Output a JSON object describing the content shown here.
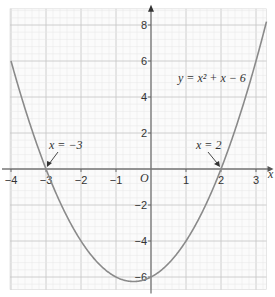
{
  "chart_data": {
    "type": "line",
    "title": "",
    "equation_label": "y = x² + x − 6",
    "xlabel": "x",
    "ylabel": "y",
    "origin_label": "O",
    "xlim": [
      -4.0,
      3.3
    ],
    "ylim": [
      -6.7,
      8.9
    ],
    "x_ticks": [
      -4,
      -3,
      -2,
      -1,
      1,
      2,
      3
    ],
    "x_tick_labels": [
      "−4",
      "−3",
      "−2",
      "−1",
      "1",
      "2",
      "3"
    ],
    "y_ticks": [
      8,
      6,
      4,
      2,
      -2,
      -4,
      -6
    ],
    "y_tick_labels": [
      "8",
      "6",
      "4",
      "2",
      "−2",
      "−4",
      "−6"
    ],
    "grid": true,
    "series": [
      {
        "name": "y = x² + x − 6",
        "color": "#8a8a8a",
        "x": [
          -4,
          -3.5,
          -3,
          -2.5,
          -2,
          -1.5,
          -1,
          -0.5,
          0,
          0.5,
          1,
          1.5,
          2,
          2.5,
          3,
          3.3
        ],
        "y": [
          6,
          2.75,
          0,
          -2.25,
          -4,
          -5.25,
          -6,
          -6.25,
          -6,
          -5.25,
          -4,
          -2.25,
          0,
          2.75,
          6,
          8.19
        ]
      }
    ],
    "annotations": [
      {
        "text": "x = −3",
        "points_to": [
          -3,
          0
        ]
      },
      {
        "text": "x = 2",
        "points_to": [
          2,
          0
        ]
      }
    ]
  },
  "labels": {
    "equation": "y = x² + x − 6",
    "root_left": "x = −3",
    "root_right": "x = 2",
    "origin": "O",
    "x_axis": "x"
  }
}
